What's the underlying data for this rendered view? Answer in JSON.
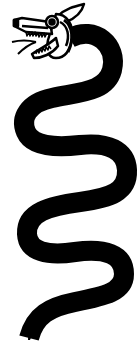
{
  "image": {
    "subject": "serpent illustration",
    "style": "black line art on white",
    "colors": {
      "ink": "#000000",
      "paper": "#ffffff"
    },
    "parts": [
      "head",
      "eye",
      "upper-jaw",
      "lower-jaw",
      "teeth",
      "tongue",
      "crest",
      "body",
      "tail"
    ]
  }
}
